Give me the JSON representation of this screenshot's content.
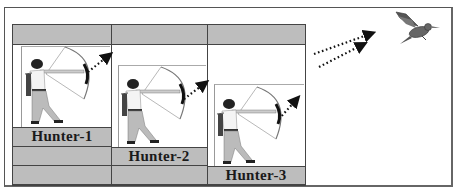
{
  "diagram": {
    "type": "hunters-shooting-bird",
    "hunters": [
      {
        "id": 1,
        "label": "Hunter-1"
      },
      {
        "id": 2,
        "label": "Hunter-2"
      },
      {
        "id": 3,
        "label": "Hunter-3"
      }
    ],
    "target": {
      "label": "",
      "icon": "bird-icon"
    },
    "arrows": {
      "count": 2,
      "style": "dotted",
      "direction": "toward-bird"
    },
    "colors": {
      "cell_gray": "#bdbdbd",
      "grid_line": "#444444",
      "label_text": "#1a1a1a",
      "arrow": "#222222",
      "bird": "#666666"
    }
  }
}
